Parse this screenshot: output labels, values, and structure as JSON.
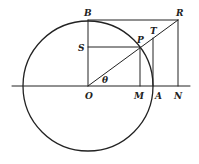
{
  "diagram": {
    "type": "geometry-figure",
    "colors": {
      "stroke": "#222222",
      "background": "#ffffff"
    },
    "labels": {
      "B": "B",
      "R": "R",
      "T": "T",
      "S": "S",
      "P": "P",
      "O": "O",
      "M": "M",
      "A": "A",
      "N": "N",
      "theta": "θ"
    },
    "points": {
      "O": [
        88,
        86
      ],
      "B": [
        88,
        20
      ],
      "R": [
        178,
        20
      ],
      "N": [
        178,
        86
      ],
      "P": [
        140,
        47
      ],
      "M": [
        140,
        86
      ],
      "S": [
        88,
        47
      ],
      "A": [
        153,
        86
      ],
      "T": [
        153,
        38
      ]
    },
    "circle": {
      "center": "O",
      "radius": 65
    }
  }
}
